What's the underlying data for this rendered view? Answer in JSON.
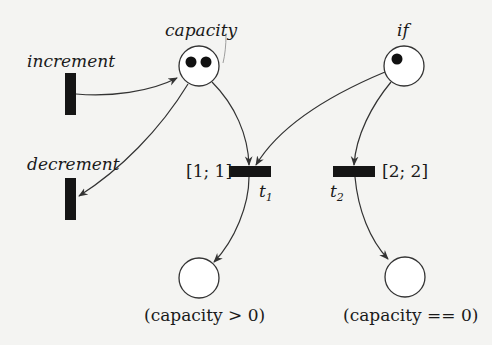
{
  "diagram": {
    "type": "petri-net",
    "places": [
      {
        "id": "capacity",
        "label": "capacity",
        "tokens": 2
      },
      {
        "id": "if",
        "label": "if",
        "tokens": 1
      },
      {
        "id": "p_pos",
        "label": "(capacity > 0)",
        "tokens": 0
      },
      {
        "id": "p_zero",
        "label": "(capacity == 0)",
        "tokens": 0
      }
    ],
    "transitions": [
      {
        "id": "increment",
        "label": "increment"
      },
      {
        "id": "decrement",
        "label": "decrement"
      },
      {
        "id": "t1",
        "label": "t",
        "subscript": "1",
        "interval": "[1; 1]"
      },
      {
        "id": "t2",
        "label": "t",
        "subscript": "2",
        "interval": "[2; 2]"
      }
    ],
    "arcs": [
      {
        "from": "increment",
        "to": "capacity"
      },
      {
        "from": "capacity",
        "to": "decrement"
      },
      {
        "from": "capacity",
        "to": "t1"
      },
      {
        "from": "if",
        "to": "t1"
      },
      {
        "from": "if",
        "to": "t2"
      },
      {
        "from": "t1",
        "to": "p_pos"
      },
      {
        "from": "t2",
        "to": "p_zero"
      }
    ]
  }
}
